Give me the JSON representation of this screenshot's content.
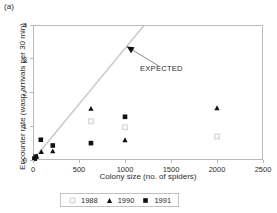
{
  "panel": {
    "label": "(a)"
  },
  "colors": {
    "axis": "#b9b9b9",
    "text": "#2b2b2b",
    "expected_line": "#cccccc",
    "marker_1988": "#d9d9d9",
    "marker_1990": "#111111",
    "marker_1991": "#111111",
    "background": "#ffffff"
  },
  "annotation": {
    "expected_label": "EXPECTED"
  },
  "legend": {
    "entries": [
      {
        "label": "1988",
        "marker": "open-square-gray-icon"
      },
      {
        "label": "1990",
        "marker": "filled-triangle-icon"
      },
      {
        "label": "1991",
        "marker": "filled-square-icon"
      }
    ]
  },
  "chart_data": {
    "type": "scatter",
    "title": "",
    "xlabel": "Colony size (no. of spiders)",
    "ylabel": "Encounter rate (wasp arrivals per 30 min)",
    "xlim": [
      0,
      2500
    ],
    "ylim": [
      0,
      4
    ],
    "xticks": [
      0,
      500,
      1000,
      1500,
      2000,
      2500
    ],
    "yticks": [
      0,
      1,
      2,
      3,
      4
    ],
    "xtick_labels": [
      "0",
      "500",
      "1000",
      "1500",
      "2000",
      "2500"
    ],
    "ytick_labels": [
      "0",
      "1",
      "2",
      "3",
      "4"
    ],
    "grid": false,
    "legend_position": "below",
    "series": [
      {
        "name": "1988",
        "marker": "open-square-gray",
        "color": "#d9d9d9",
        "points": [
          {
            "x": 630,
            "y": 1.15
          },
          {
            "x": 1000,
            "y": 0.97
          },
          {
            "x": 2000,
            "y": 0.7
          }
        ]
      },
      {
        "name": "1990",
        "marker": "filled-triangle",
        "color": "#111111",
        "points": [
          {
            "x": 20,
            "y": 0.06
          },
          {
            "x": 40,
            "y": 0.12
          },
          {
            "x": 90,
            "y": 0.25
          },
          {
            "x": 215,
            "y": 0.27
          },
          {
            "x": 630,
            "y": 1.53
          },
          {
            "x": 1000,
            "y": 0.6
          },
          {
            "x": 2000,
            "y": 1.55
          }
        ]
      },
      {
        "name": "1991",
        "marker": "filled-square",
        "color": "#111111",
        "points": [
          {
            "x": 15,
            "y": 0.04
          },
          {
            "x": 30,
            "y": 0.1
          },
          {
            "x": 85,
            "y": 0.6
          },
          {
            "x": 215,
            "y": 0.43
          },
          {
            "x": 630,
            "y": 0.5
          },
          {
            "x": 1000,
            "y": 1.28
          }
        ]
      }
    ],
    "reference_line": {
      "name": "EXPECTED",
      "x0": 0,
      "y0": 0,
      "x1": 1210,
      "y1": 4.0,
      "color": "#cccccc"
    },
    "annotation_arrow": {
      "label": "EXPECTED",
      "tip_x": 1020,
      "tip_y": 3.36,
      "tail_x": 1370,
      "tail_y": 2.78
    }
  }
}
